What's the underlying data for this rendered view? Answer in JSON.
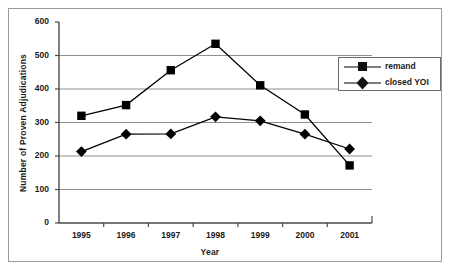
{
  "chart_data": {
    "type": "line",
    "title": "",
    "xlabel": "Year",
    "ylabel": "Number of Proven Adjudications",
    "categories": [
      "1995",
      "1996",
      "1997",
      "1998",
      "1999",
      "2000",
      "2001"
    ],
    "yticks": [
      "0",
      "100",
      "200",
      "300",
      "400",
      "500",
      "600"
    ],
    "ylim": [
      0,
      600
    ],
    "grid": "horizontal",
    "legend_position": "upper-right",
    "series": [
      {
        "name": "remand",
        "marker": "square",
        "color": "#000000",
        "values": [
          320,
          352,
          456,
          535,
          411,
          324,
          172
        ]
      },
      {
        "name": "closed YOI",
        "marker": "diamond",
        "color": "#000000",
        "values": [
          213,
          265,
          266,
          317,
          305,
          265,
          221
        ]
      }
    ]
  },
  "legend": {
    "items": [
      {
        "label": "remand",
        "marker": "square-marker"
      },
      {
        "label": "closed YOI",
        "marker": "diamond-marker"
      }
    ]
  }
}
